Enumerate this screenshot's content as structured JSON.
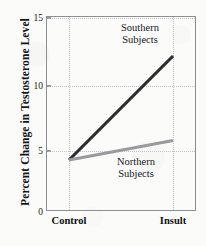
{
  "chart_data": {
    "type": "line",
    "title": "",
    "xlabel": "",
    "ylabel": "Percent Change in Testosterone Level",
    "categories": [
      "Control",
      "Insult"
    ],
    "x": [
      0,
      1
    ],
    "xlim": [
      -0.21,
      1.23
    ],
    "ylim": [
      0,
      15
    ],
    "yticks": [
      0,
      5,
      10,
      15
    ],
    "ytick_labels": [
      "0",
      "5",
      "10",
      "15"
    ],
    "grid": true,
    "grid_style": "dotted",
    "legend_position": "inline-annotation",
    "series": [
      {
        "name": "Southern Subjects",
        "values": [
          4,
          12
        ],
        "color": "#2b2b30",
        "line_width": 3.1,
        "annotation_line1": "Southern",
        "annotation_line2": "Subjects"
      },
      {
        "name": "Northern Subjects",
        "values": [
          4,
          5.5
        ],
        "color": "#9a9a9e",
        "line_width": 3.1,
        "annotation_line1": "Northern",
        "annotation_line2": "Subjects"
      }
    ],
    "colors": {
      "background": "#fbfbfa",
      "frame": "#8d8d92",
      "grid": "#c3c3c6",
      "text": "#16171b",
      "southern": "#2b2b30",
      "northern": "#9a9a9e"
    }
  },
  "axis": {
    "y_title": "Percent Change in Testosterone Level",
    "y_tick_0": "0",
    "y_tick_5": "5",
    "y_tick_10": "10",
    "y_tick_15": "15",
    "x_tick_control": "Control",
    "x_tick_insult": "Insult"
  },
  "annotations": {
    "southern_line1": "Southern",
    "southern_line2": "Subjects",
    "northern_line1": "Northern",
    "northern_line2": "Subjects"
  }
}
